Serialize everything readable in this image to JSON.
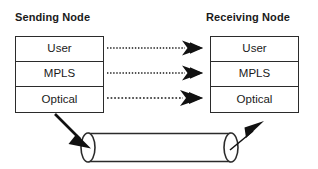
{
  "diagram": {
    "title_sending": "Sending Node",
    "title_receiving": "Receiving Node",
    "layers": [
      "User",
      "MPLS",
      "Optical"
    ],
    "sending_layers": [
      {
        "label": "User"
      },
      {
        "label": "MPLS"
      },
      {
        "label": "Optical"
      }
    ],
    "receiving_layers": [
      {
        "label": "User"
      },
      {
        "label": "MPLS"
      },
      {
        "label": "Optical"
      }
    ],
    "peer_flows": [
      {
        "from": "User",
        "to": "User",
        "style": "dotted",
        "direction": "left-to-right"
      },
      {
        "from": "MPLS",
        "to": "MPLS",
        "style": "dotted",
        "direction": "left-to-right"
      },
      {
        "from": "Optical",
        "to": "Optical",
        "style": "dotted",
        "direction": "left-to-right"
      }
    ],
    "physical_link": {
      "shape": "cylinder",
      "ingress_arrow": "down-right",
      "egress_arrow": "up-right"
    },
    "colors": {
      "stroke": "#2b2b2b",
      "fill": "#ffffff",
      "text": "#1a1a1a",
      "arrow": "#111111"
    }
  }
}
